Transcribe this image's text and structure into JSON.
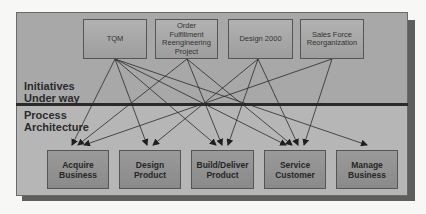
{
  "sections": {
    "upper_label": [
      "Initiatives",
      "Under way"
    ],
    "lower_label": [
      "Process",
      "Architecture"
    ]
  },
  "initiatives": [
    {
      "id": "tqm",
      "lines": [
        "TQM"
      ]
    },
    {
      "id": "order",
      "lines": [
        "Order",
        "Fulfillment",
        "Reengineering",
        "Project"
      ]
    },
    {
      "id": "design2000",
      "lines": [
        "Design 2000"
      ]
    },
    {
      "id": "salesforce",
      "lines": [
        "Sales Force",
        "Reorganization"
      ]
    }
  ],
  "processes": [
    {
      "id": "acquire",
      "lines": [
        "Acquire",
        "Business"
      ]
    },
    {
      "id": "design",
      "lines": [
        "Design",
        "Product"
      ]
    },
    {
      "id": "build",
      "lines": [
        "Build/Deliver",
        "Product"
      ]
    },
    {
      "id": "service",
      "lines": [
        "Service",
        "Customer"
      ]
    },
    {
      "id": "manage",
      "lines": [
        "Manage",
        "Business"
      ]
    }
  ],
  "connections": [
    {
      "from": "tqm",
      "to": "acquire"
    },
    {
      "from": "tqm",
      "to": "design"
    },
    {
      "from": "tqm",
      "to": "build"
    },
    {
      "from": "tqm",
      "to": "service"
    },
    {
      "from": "tqm",
      "to": "manage"
    },
    {
      "from": "order",
      "to": "acquire"
    },
    {
      "from": "order",
      "to": "build"
    },
    {
      "from": "order",
      "to": "service"
    },
    {
      "from": "design2000",
      "to": "design"
    },
    {
      "from": "design2000",
      "to": "build"
    },
    {
      "from": "design2000",
      "to": "service"
    },
    {
      "from": "salesforce",
      "to": "acquire"
    },
    {
      "from": "salesforce",
      "to": "service"
    }
  ],
  "colors": {
    "panel_upper": "#a8a8a8",
    "panel_lower": "#b6b6b6",
    "divider": "#2a2a2a",
    "line": "#2a2a2a"
  }
}
